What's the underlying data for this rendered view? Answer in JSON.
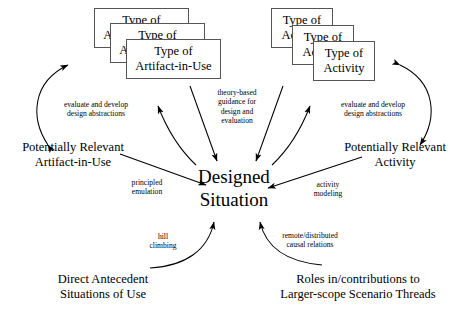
{
  "diagram": {
    "stroke_color": "#000000",
    "box_border_color": "#555555",
    "background": "#ffffff",
    "center": {
      "line1": "Designed",
      "line2": "Situation"
    },
    "artifact_stack": {
      "back": {
        "line1": "Type of",
        "line2": "Artifact-in-Use"
      },
      "middle": {
        "line1": "Type of",
        "line2": "Artifact-in-Use"
      },
      "front": {
        "line1": "Type of",
        "line2": "Artifact-in-Use"
      }
    },
    "activity_stack": {
      "back": {
        "line1": "Type of",
        "line2": "Activity"
      },
      "middle": {
        "line1": "Type of",
        "line2": "Activity"
      },
      "front": {
        "line1": "Type of",
        "line2": "Activity"
      }
    },
    "nodes": {
      "artifact_in_use": {
        "line1": "Potentially Relevant",
        "line2": "Artifact-in-Use"
      },
      "activity": {
        "line1": "Potentially Relevant",
        "line2": "Activity"
      },
      "antecedent": {
        "line1": "Direct Antecedent",
        "line2": "Situations of Use"
      },
      "scenario_threads": {
        "line1": "Roles in/contributions to",
        "line2": "Larger-scope Scenario Threads"
      }
    },
    "edge_labels": {
      "evaluate_left": {
        "line1": "evaluate and develop",
        "line2": "design abstractions"
      },
      "evaluate_right": {
        "line1": "evaluate and develop",
        "line2": "design abstractions"
      },
      "theory_based": {
        "line1": "theory-based",
        "line2": "guidance for",
        "line3": "design and",
        "line4": "evaluation"
      },
      "principled_emulation": {
        "line1": "principled",
        "line2": "emulation"
      },
      "activity_modeling": {
        "line1": "activity",
        "line2": "modeling"
      },
      "hill_climbing": {
        "line1": "hill",
        "line2": "climbing"
      },
      "causal_relations": {
        "line1": "remote/distributed",
        "line2": "causal relations"
      }
    }
  }
}
